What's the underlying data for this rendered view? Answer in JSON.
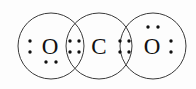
{
  "diagram": {
    "type": "lewis-dot-structure",
    "background_color": "#fdfdfd",
    "stroke_color": "#3a3a3a",
    "text_color": "#111111",
    "dot_color": "#111111",
    "dot_radius": 1.7,
    "shells": [
      {
        "id": "shell-left-oxygen",
        "cx": 51,
        "cy": 46,
        "r": 33
      },
      {
        "id": "shell-center-carbon",
        "cx": 99,
        "cy": 46,
        "r": 33
      },
      {
        "id": "shell-right-oxygen",
        "cx": 153,
        "cy": 46,
        "r": 33
      }
    ],
    "atoms": [
      {
        "id": "atom-left-oxygen",
        "symbol": "O",
        "element": "oxygen",
        "x": 50,
        "y": 46
      },
      {
        "id": "atom-center-carbon",
        "symbol": "C",
        "element": "carbon",
        "x": 99,
        "y": 46
      },
      {
        "id": "atom-right-oxygen",
        "symbol": "O",
        "element": "oxygen",
        "x": 152,
        "y": 46
      }
    ],
    "electron_groups": [
      {
        "id": "lone-pair-left-oxygen-left",
        "label": "lone pair on left oxygen (left side)",
        "atom": "left-oxygen",
        "shared": false,
        "dots": [
          {
            "x": 30,
            "y": 41
          },
          {
            "x": 30,
            "y": 52
          }
        ]
      },
      {
        "id": "lone-pair-left-oxygen-bottom",
        "label": "lone pair on left oxygen (bottom)",
        "atom": "left-oxygen",
        "shared": false,
        "dots": [
          {
            "x": 46,
            "y": 62
          },
          {
            "x": 56,
            "y": 62
          }
        ]
      },
      {
        "id": "bonding-pairs-left-overlap",
        "label": "double bond shared electrons between left oxygen and carbon",
        "atom": "left-oxygen-carbon",
        "shared": true,
        "dots": [
          {
            "x": 70,
            "y": 41
          },
          {
            "x": 79,
            "y": 41
          },
          {
            "x": 70,
            "y": 52
          },
          {
            "x": 79,
            "y": 52
          }
        ]
      },
      {
        "id": "bonding-pairs-right-overlap",
        "label": "double bond shared electrons between carbon and right oxygen",
        "atom": "carbon-right-oxygen",
        "shared": true,
        "dots": [
          {
            "x": 120,
            "y": 41
          },
          {
            "x": 129,
            "y": 41
          },
          {
            "x": 120,
            "y": 52
          },
          {
            "x": 129,
            "y": 52
          }
        ]
      },
      {
        "id": "lone-pair-right-oxygen-top",
        "label": "lone pair on right oxygen (top)",
        "atom": "right-oxygen",
        "shared": false,
        "dots": [
          {
            "x": 148,
            "y": 27
          },
          {
            "x": 158,
            "y": 27
          }
        ]
      },
      {
        "id": "lone-pair-right-oxygen-right",
        "label": "lone pair on right oxygen (right side)",
        "atom": "right-oxygen",
        "shared": false,
        "dots": [
          {
            "x": 171,
            "y": 41
          },
          {
            "x": 171,
            "y": 52
          }
        ]
      }
    ]
  }
}
